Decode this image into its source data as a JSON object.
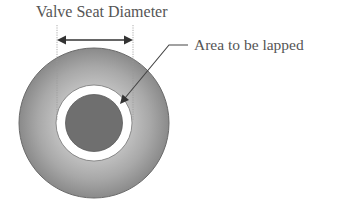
{
  "diagram": {
    "title_label": "Valve Seat Diameter",
    "callout_label": "Area to be lapped",
    "colors": {
      "outer_disc_light": "#bdbdbd",
      "outer_disc_dark": "#8c8c8c",
      "outer_disc_edge": "#5e5e5e",
      "lapping_ring": "#ffffff",
      "inner_core": "#6f6f6f",
      "arrow": "#333333",
      "dotted_guide": "#9a9a9a",
      "text": "#555555"
    }
  }
}
